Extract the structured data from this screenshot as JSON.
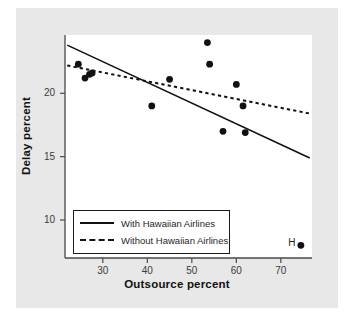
{
  "chart_data": {
    "type": "scatter",
    "title": "",
    "xlabel": "Outsource percent",
    "ylabel": "Delay percent",
    "xlim": [
      21.5,
      77.0
    ],
    "ylim": [
      7.0,
      24.6
    ],
    "xticks": [
      30,
      40,
      50,
      60,
      70
    ],
    "yticks": [
      10,
      15,
      20
    ],
    "grid": false,
    "legend_position": "bottom-left",
    "points": [
      {
        "x": 24.5,
        "y": 22.3
      },
      {
        "x": 26.0,
        "y": 21.2
      },
      {
        "x": 27.0,
        "y": 21.5
      },
      {
        "x": 27.6,
        "y": 21.6
      },
      {
        "x": 41.0,
        "y": 19.0
      },
      {
        "x": 45.0,
        "y": 21.1
      },
      {
        "x": 53.5,
        "y": 24.0
      },
      {
        "x": 54.0,
        "y": 22.3
      },
      {
        "x": 57.0,
        "y": 17.0
      },
      {
        "x": 60.0,
        "y": 20.7
      },
      {
        "x": 61.5,
        "y": 19.0
      },
      {
        "x": 62.0,
        "y": 16.9
      },
      {
        "x": 74.5,
        "y": 8.0,
        "label": "H"
      }
    ],
    "series": [
      {
        "name": "With Hawaiian Airlines",
        "style": "solid",
        "type": "trendline",
        "x": [
          22.0,
          76.5
        ],
        "values": [
          23.8,
          14.9
        ]
      },
      {
        "name": "Without Hawaiian Airlines",
        "style": "dashed",
        "type": "trendline",
        "x": [
          22.0,
          76.5
        ],
        "values": [
          22.2,
          18.4
        ]
      }
    ],
    "annotations": [
      {
        "text": "H",
        "x": 72.8,
        "y": 8.1
      }
    ],
    "colors": {
      "marker": "#111111",
      "line": "#111111",
      "panel_background": "#ffffff",
      "figure_background": "#e8e8e8",
      "axis": "#4a4a4a",
      "text": "#111111"
    }
  },
  "axes": {
    "x_label": "Outsource percent",
    "y_label": "Delay percent",
    "x_tick_labels": [
      "30",
      "40",
      "50",
      "60",
      "70"
    ],
    "y_tick_labels": [
      "20",
      "15",
      "10"
    ]
  },
  "legend": {
    "entries": [
      {
        "label": "With Hawaiian Airlines",
        "style": "solid"
      },
      {
        "label": "Without Hawaiian Airlines",
        "style": "dashed"
      }
    ]
  },
  "annotation": {
    "h_label": "H"
  }
}
